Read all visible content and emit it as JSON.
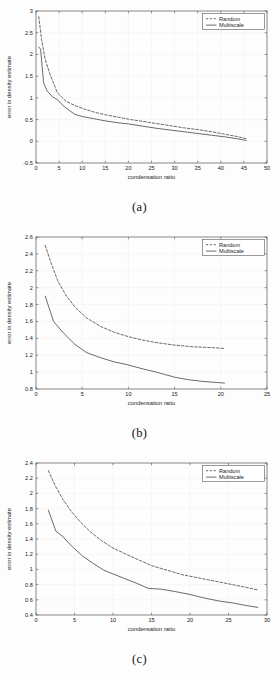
{
  "figure": {
    "panels": [
      "a",
      "b",
      "c"
    ],
    "captions": {
      "a": "(a)",
      "b": "(b)",
      "c": "(c)"
    }
  },
  "legend": {
    "entries": [
      {
        "label": "Random",
        "style": "dashed"
      },
      {
        "label": "Multiscale",
        "style": "solid"
      }
    ]
  },
  "colors": {
    "line": "#3a3a3a",
    "axis": "#555555",
    "grid": "#cccccc",
    "background": "#ffffff"
  },
  "chart_data": [
    {
      "type": "line",
      "title": "(a)",
      "xlabel": "condensation ratio",
      "ylabel": "error in density estimate",
      "xlim": [
        0,
        50
      ],
      "ylim": [
        -0.5,
        3
      ],
      "xticks": [
        0,
        5,
        10,
        15,
        20,
        25,
        30,
        35,
        40,
        45,
        50
      ],
      "yticks": [
        -0.5,
        0,
        0.5,
        1,
        1.5,
        2,
        2.5,
        3
      ],
      "grid": true,
      "legend_position": "top-right",
      "series": [
        {
          "name": "Random",
          "style": "dashed",
          "x": [
            0.6,
            1.2,
            2.0,
            3.0,
            4.6,
            6.5,
            8.5,
            10.5,
            13.0,
            15.5,
            18.0,
            20.5,
            23.0,
            26.0,
            29.0,
            32.0,
            35.0,
            38.0,
            41.0,
            43.5,
            45.5
          ],
          "y": [
            2.87,
            2.35,
            1.88,
            1.55,
            1.12,
            0.92,
            0.82,
            0.74,
            0.66,
            0.6,
            0.55,
            0.5,
            0.46,
            0.41,
            0.36,
            0.31,
            0.27,
            0.22,
            0.16,
            0.11,
            0.06
          ]
        },
        {
          "name": "Multiscale",
          "style": "solid",
          "x": [
            0.6,
            1.0,
            1.6,
            1.7,
            2.4,
            3.6,
            4.6,
            6.2,
            8.4,
            10.0,
            12.5,
            15.0,
            17.5,
            20.0,
            23.0,
            26.0,
            29.0,
            32.0,
            35.0,
            38.0,
            41.0,
            43.5,
            45.5
          ],
          "y": [
            2.17,
            2.12,
            1.4,
            1.33,
            1.16,
            1.02,
            0.96,
            0.79,
            0.62,
            0.57,
            0.52,
            0.47,
            0.43,
            0.4,
            0.35,
            0.3,
            0.26,
            0.22,
            0.18,
            0.14,
            0.1,
            0.06,
            0.02
          ]
        }
      ]
    },
    {
      "type": "line",
      "title": "(b)",
      "xlabel": "condensation ratio",
      "ylabel": "error in density estimate",
      "xlim": [
        0,
        25
      ],
      "ylim": [
        0.8,
        2.6
      ],
      "xticks": [
        0,
        5,
        10,
        15,
        20,
        25
      ],
      "yticks": [
        0.8,
        1,
        1.2,
        1.4,
        1.6,
        1.8,
        2,
        2.2,
        2.4,
        2.6
      ],
      "grid": true,
      "legend_position": "top-right",
      "series": [
        {
          "name": "Random",
          "style": "dashed",
          "x": [
            1.0,
            1.6,
            2.4,
            3.3,
            4.3,
            5.5,
            7.0,
            8.5,
            10.0,
            11.5,
            13.0,
            15.0,
            17.0,
            19.0,
            20.4
          ],
          "y": [
            2.5,
            2.3,
            2.07,
            1.9,
            1.76,
            1.64,
            1.54,
            1.47,
            1.42,
            1.38,
            1.35,
            1.32,
            1.3,
            1.29,
            1.28
          ]
        },
        {
          "name": "Multiscale",
          "style": "solid",
          "x": [
            1.0,
            1.9,
            3.0,
            4.2,
            5.5,
            7.0,
            8.5,
            9.8,
            11.5,
            13.0,
            15.0,
            16.5,
            18.0,
            20.4
          ],
          "y": [
            1.9,
            1.6,
            1.46,
            1.33,
            1.23,
            1.17,
            1.12,
            1.09,
            1.04,
            1.0,
            0.94,
            0.91,
            0.89,
            0.87
          ]
        }
      ]
    },
    {
      "type": "line",
      "title": "(c)",
      "xlabel": "condensation ratio",
      "ylabel": "error in density estimate",
      "xlim": [
        0,
        30
      ],
      "ylim": [
        0.4,
        2.4
      ],
      "xticks": [
        0,
        5,
        10,
        15,
        20,
        25,
        30
      ],
      "yticks": [
        0.4,
        0.6,
        0.8,
        1,
        1.2,
        1.4,
        1.6,
        1.8,
        2,
        2.2,
        2.4
      ],
      "grid": true,
      "legend_position": "top-right",
      "series": [
        {
          "name": "Random",
          "style": "dashed",
          "x": [
            1.6,
            2.5,
            3.5,
            4.6,
            5.8,
            7.0,
            8.5,
            10.0,
            11.5,
            13.0,
            15.0,
            17.0,
            19.0,
            21.0,
            23.0,
            25.0,
            27.0,
            28.8
          ],
          "y": [
            2.3,
            2.1,
            1.92,
            1.76,
            1.62,
            1.5,
            1.38,
            1.28,
            1.21,
            1.14,
            1.05,
            0.99,
            0.93,
            0.89,
            0.85,
            0.81,
            0.77,
            0.73
          ]
        },
        {
          "name": "Multiscale",
          "style": "solid",
          "x": [
            1.6,
            2.6,
            3.4,
            4.6,
            6.0,
            7.4,
            8.8,
            10.0,
            11.5,
            13.0,
            14.6,
            16.2,
            18.0,
            20.0,
            22.0,
            24.0,
            25.5,
            27.0,
            28.8
          ],
          "y": [
            1.78,
            1.5,
            1.44,
            1.31,
            1.18,
            1.08,
            0.99,
            0.94,
            0.88,
            0.82,
            0.75,
            0.74,
            0.71,
            0.67,
            0.62,
            0.58,
            0.56,
            0.53,
            0.5
          ]
        }
      ]
    }
  ]
}
